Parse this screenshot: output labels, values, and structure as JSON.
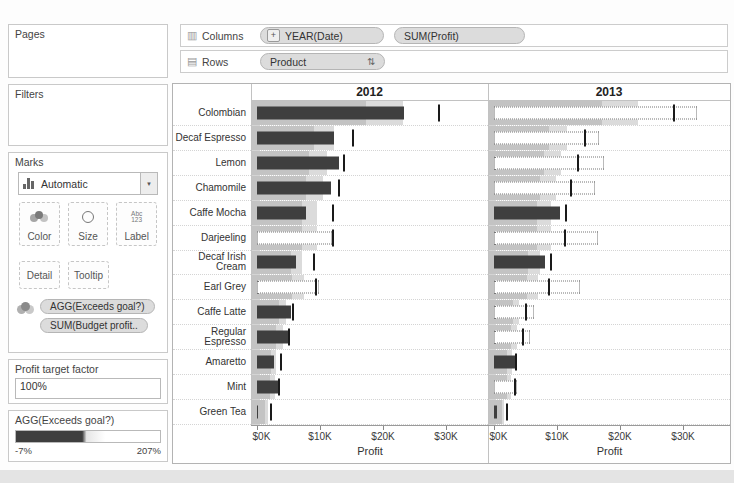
{
  "icons": {
    "columns_shelf": "▥",
    "rows_shelf": "▤",
    "plus": "+",
    "sort": "⇅",
    "dropdown_caret": "▼",
    "label_icon_top": "Abc",
    "label_icon_bottom": "123"
  },
  "shelves": {
    "columns": {
      "label": "Columns",
      "pills": [
        {
          "label": "YEAR(Date)",
          "prefix": "+"
        },
        {
          "label": "SUM(Profit)"
        }
      ]
    },
    "rows": {
      "label": "Rows",
      "pills": [
        {
          "label": "Product"
        }
      ]
    }
  },
  "sidebar": {
    "pages": {
      "title": "Pages"
    },
    "filters": {
      "title": "Filters"
    },
    "marks": {
      "title": "Marks",
      "mark_type": "Automatic",
      "buttons": [
        "Color",
        "Size",
        "Label",
        "Detail",
        "Tooltip"
      ],
      "pills": [
        "AGG(Exceeds goal?)",
        "SUM(Budget profit.."
      ]
    },
    "parameter": {
      "title": "Profit target factor",
      "value": "100%"
    },
    "legend": {
      "title": "AGG(Exceeds goal?)",
      "min": "-7%",
      "max": "207%"
    }
  },
  "chart_data": {
    "type": "bar",
    "subtype": "bullet-graph",
    "title": "",
    "xlabel": "Profit",
    "ylabel": "Product",
    "x_ticks": [
      "$0K",
      "$10K",
      "$20K",
      "$30K"
    ],
    "x_tick_values": [
      0,
      10,
      20,
      30
    ],
    "xlim": [
      0,
      36.5
    ],
    "units": "USD thousands",
    "grid": false,
    "reference_bands_pct_of_target": [
      60,
      80
    ],
    "categories": [
      "Colombian",
      "Decaf Espresso",
      "Lemon",
      "Chamomile",
      "Caffe Mocha",
      "Darjeeling",
      "Decaf Irish Cream",
      "Earl Grey",
      "Caffe Latte",
      "Regular Espresso",
      "Amaretto",
      "Mint",
      "Green Tea"
    ],
    "series": [
      {
        "name": "2012",
        "values": [
          23.3,
          12.2,
          13.0,
          11.7,
          7.8,
          12.2,
          6.2,
          10.2,
          5.4,
          4.9,
          2.7,
          3.4,
          0.2
        ],
        "targets": [
          28.9,
          15.2,
          13.8,
          13.0,
          12.0,
          12.0,
          9.0,
          9.3,
          5.7,
          5.1,
          3.8,
          3.5,
          2.2
        ],
        "exceeds_goal": [
          false,
          false,
          false,
          false,
          false,
          true,
          false,
          true,
          false,
          false,
          false,
          false,
          false
        ]
      },
      {
        "name": "2013",
        "values": [
          32.5,
          17.0,
          17.7,
          16.4,
          10.5,
          16.9,
          8.1,
          14.0,
          6.7,
          6.0,
          3.4,
          4.0,
          0.5
        ],
        "targets": [
          28.6,
          14.5,
          13.3,
          12.3,
          11.4,
          11.3,
          9.1,
          8.8,
          5.0,
          4.6,
          3.5,
          3.4,
          2.0
        ],
        "exceeds_goal": [
          true,
          true,
          true,
          true,
          false,
          true,
          false,
          true,
          true,
          true,
          false,
          true,
          false
        ]
      }
    ]
  },
  "colors": {
    "bar_filled": "#3f3f3f",
    "bar_empty": "#ffffff",
    "bar_empty_border": "#777777",
    "band_inner": "#c3c3c3",
    "band_outer": "#dbdbdb",
    "reference_line": "#1a1a1a",
    "pill_bg": "#dcdcdc",
    "legend_gradient_dark": "#3e3e3e"
  }
}
